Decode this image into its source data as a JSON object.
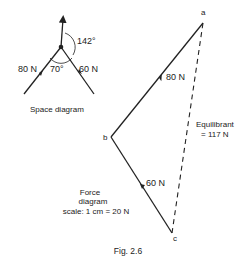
{
  "space_diagram": {
    "label": "Space diagram",
    "force_left": "80 N",
    "force_right": "60 N",
    "angle_between": "70°",
    "angle_up": "142°"
  },
  "force_diagram": {
    "title_line1": "Force",
    "title_line2": "diagram",
    "scale": "scale: 1 cm = 20 N",
    "point_a": "a",
    "point_b": "b",
    "point_c": "c",
    "ab_label": "80 N",
    "bc_label": "60 N",
    "equilibrant_line1": "Equilibrant",
    "equilibrant_line2": "= 117 N"
  },
  "caption": "Fig. 2.6",
  "colors": {
    "ink": "#222222",
    "background": "#ffffff"
  }
}
